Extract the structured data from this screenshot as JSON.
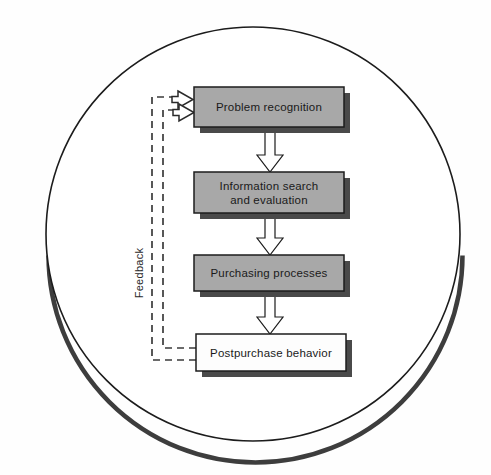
{
  "figure": {
    "type": "flowchart",
    "container_shape": "circle",
    "colors": {
      "box_fill_gray": "#a8a8a8",
      "box_fill_white": "#fdfdfd",
      "box_border": "#1c1c1c",
      "shadow": "#4a4a4a",
      "circle_stroke": "#1c1c1c",
      "background": "#fefefe",
      "dashed_line": "#3b3b3b",
      "text": "#1a1a1a"
    }
  },
  "nodes": [
    {
      "id": "problem-recognition",
      "label": "Problem recognition",
      "fill": "gray",
      "order": 1
    },
    {
      "id": "information-search",
      "label": "Information search\nand evaluation",
      "line1": "Information search",
      "line2": "and evaluation",
      "fill": "gray",
      "order": 2
    },
    {
      "id": "purchasing-processes",
      "label": "Purchasing processes",
      "fill": "gray",
      "order": 3
    },
    {
      "id": "postpurchase-behavior",
      "label": "Postpurchase behavior",
      "fill": "white",
      "order": 4
    }
  ],
  "connectors": [
    {
      "id": "arrow-1",
      "from": "problem-recognition",
      "to": "information-search",
      "style": "solid-hollow-block-arrow",
      "direction": "down"
    },
    {
      "id": "arrow-2",
      "from": "information-search",
      "to": "purchasing-processes",
      "style": "solid-hollow-block-arrow",
      "direction": "down"
    },
    {
      "id": "arrow-3",
      "from": "purchasing-processes",
      "to": "postpurchase-behavior",
      "style": "solid-hollow-block-arrow",
      "direction": "down"
    },
    {
      "id": "feedback-outer",
      "from": "postpurchase-behavior",
      "to": "problem-recognition",
      "style": "dashed-block-arrow",
      "direction": "left-up-right"
    },
    {
      "id": "feedback-inner",
      "from": "postpurchase-behavior",
      "to": "problem-recognition",
      "style": "dashed-block-arrow",
      "direction": "left-up-right"
    }
  ],
  "annotations": {
    "feedback_label": "Feedback",
    "feedback_label_orientation": "vertical-bottom-to-top"
  }
}
